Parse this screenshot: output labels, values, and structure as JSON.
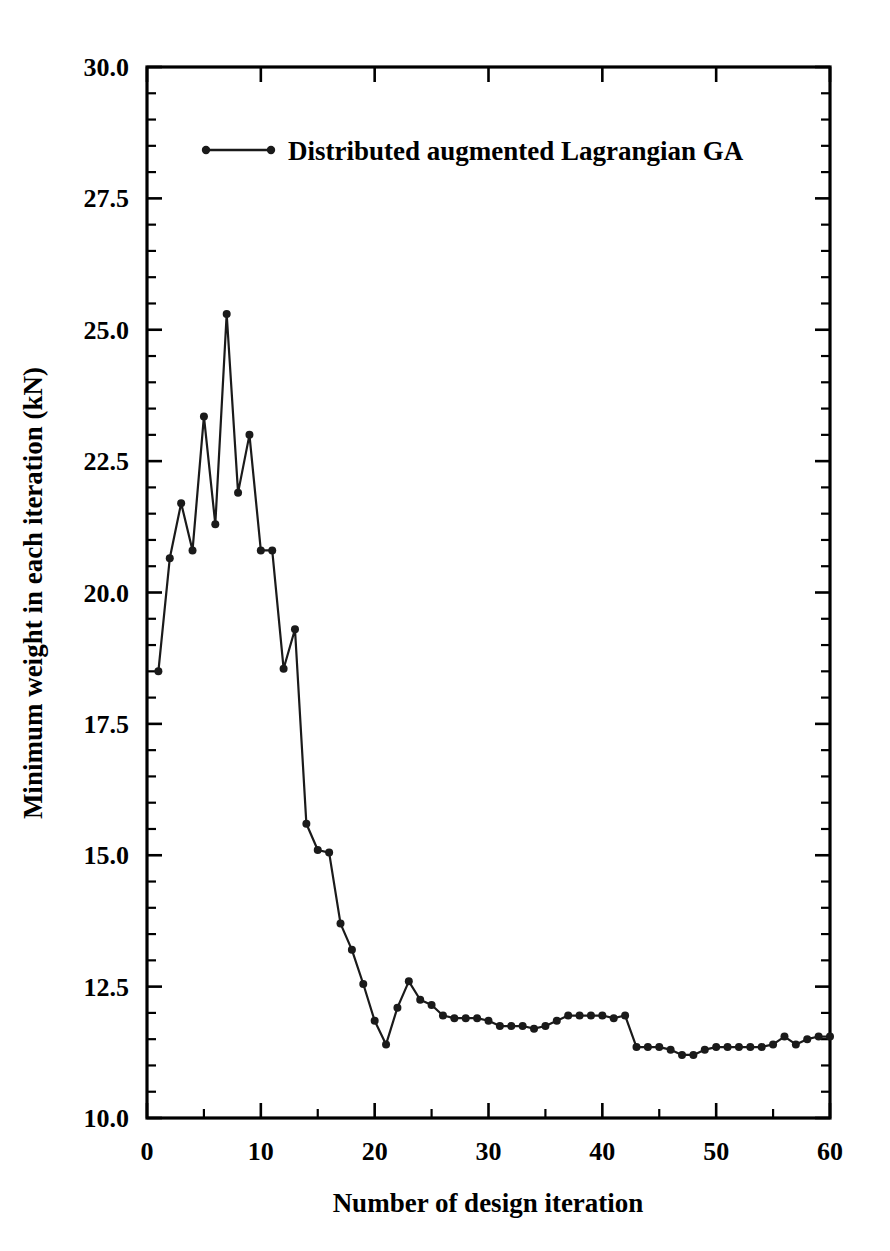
{
  "chart_data": {
    "type": "line",
    "title": "",
    "xlabel": "Number of design iteration",
    "ylabel": "Minimum weight in each iteration (kN)",
    "xlim": [
      0,
      60
    ],
    "ylim": [
      10.0,
      30.0
    ],
    "grid": false,
    "legend_position": "top-center",
    "x_major_ticks": [
      0,
      10,
      20,
      30,
      40,
      50,
      60
    ],
    "x_tick_labels": [
      "0",
      "10",
      "20",
      "30",
      "40",
      "50",
      "60"
    ],
    "x_minor_ticks": [
      5,
      15,
      25,
      35,
      45,
      55
    ],
    "y_major_ticks": [
      10.0,
      12.5,
      15.0,
      17.5,
      20.0,
      22.5,
      25.0,
      27.5,
      30.0
    ],
    "y_tick_labels": [
      "10.0",
      "12.5",
      "15.0",
      "17.5",
      "20.0",
      "22.5",
      "25.0",
      "27.5",
      "30.0"
    ],
    "y_minor_tick_step": 0.5,
    "series": [
      {
        "name": "Distributed augmented Lagrangian GA",
        "color": "#1a1a1a",
        "marker": "circle",
        "x": [
          1,
          2,
          3,
          4,
          5,
          6,
          7,
          8,
          9,
          10,
          11,
          12,
          13,
          14,
          15,
          16,
          17,
          18,
          19,
          20,
          21,
          22,
          23,
          24,
          25,
          26,
          27,
          28,
          29,
          30,
          31,
          32,
          33,
          34,
          35,
          36,
          37,
          38,
          39,
          40,
          41,
          42,
          43,
          44,
          45,
          46,
          47,
          48,
          49,
          50,
          51,
          52,
          53,
          54,
          55,
          56,
          57,
          58,
          59,
          60
        ],
        "values": [
          18.5,
          20.65,
          21.7,
          20.8,
          23.35,
          21.3,
          25.3,
          21.9,
          23.0,
          20.8,
          20.8,
          18.55,
          19.3,
          15.6,
          15.1,
          15.05,
          13.7,
          13.2,
          12.55,
          11.85,
          11.4,
          12.1,
          12.6,
          12.25,
          12.15,
          11.95,
          11.9,
          11.9,
          11.9,
          11.85,
          11.75,
          11.75,
          11.75,
          11.7,
          11.75,
          11.85,
          11.95,
          11.95,
          11.95,
          11.95,
          11.9,
          11.95,
          11.35,
          11.35,
          11.35,
          11.3,
          11.2,
          11.2,
          11.3,
          11.35,
          11.35,
          11.35,
          11.35,
          11.35,
          11.4,
          11.55,
          11.4,
          11.5,
          11.55,
          11.55
        ]
      }
    ]
  },
  "legend": {
    "entries": [
      {
        "label": "Distributed augmented Lagrangian GA"
      }
    ]
  },
  "axes": {
    "x_title": "Number of design iteration",
    "y_title": "Minimum weight in each iteration (kN)"
  }
}
